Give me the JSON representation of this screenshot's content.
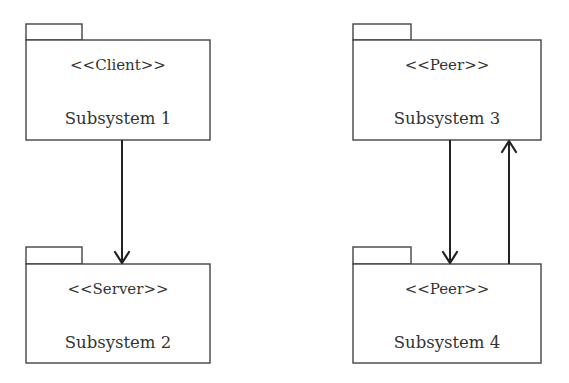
{
  "diagram": {
    "type": "UML package diagram",
    "packages": [
      {
        "id": "p1",
        "stereotype": "<<Client>>",
        "name": "Subsystem 1"
      },
      {
        "id": "p2",
        "stereotype": "<<Server>>",
        "name": "Subsystem 2"
      },
      {
        "id": "p3",
        "stereotype": "<<Peer>>",
        "name": "Subsystem 3"
      },
      {
        "id": "p4",
        "stereotype": "<<Peer>>",
        "name": "Subsystem 4"
      }
    ],
    "dependencies": [
      {
        "from": "Subsystem 1",
        "to": "Subsystem 2",
        "direction": "down"
      },
      {
        "from": "Subsystem 3",
        "to": "Subsystem 4",
        "direction": "down"
      },
      {
        "from": "Subsystem 4",
        "to": "Subsystem 3",
        "direction": "up"
      }
    ],
    "colors": {
      "line": "#444444",
      "arrow": "#222222",
      "text": "#333333",
      "background": "#ffffff"
    }
  }
}
